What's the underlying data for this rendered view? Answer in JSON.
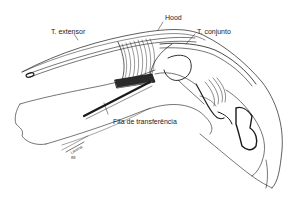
{
  "diagram": {
    "labels": {
      "extensor": "T. extensor",
      "hood": "Hood",
      "conjunto": "T. conjunto",
      "fita": "Fita de transferência"
    },
    "signature": {
      "name": "Lamina",
      "year": "88"
    },
    "colors": {
      "background": "#ffffff",
      "ink": "#1a1a1a",
      "text": "#222222"
    }
  }
}
